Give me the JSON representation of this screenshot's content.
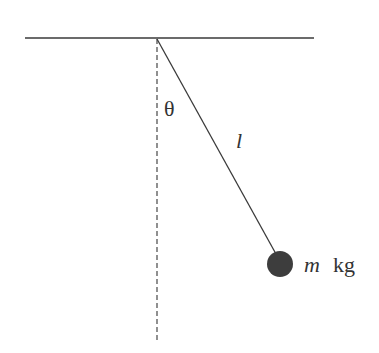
{
  "diagram": {
    "type": "simple-pendulum",
    "labels": {
      "angle": "θ",
      "length": "l",
      "mass_symbol": "m",
      "mass_unit": "kg"
    },
    "colors": {
      "line": "#3a3a3a",
      "dashed": "#555555",
      "bob": "#3d3d3d",
      "background": "#ffffff"
    }
  }
}
